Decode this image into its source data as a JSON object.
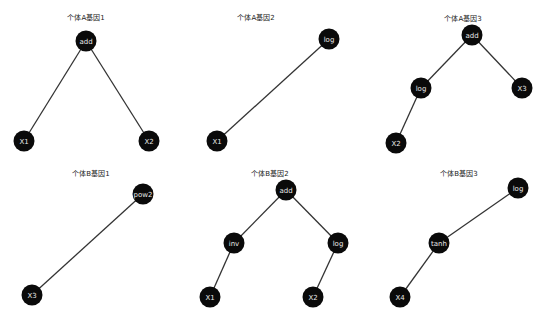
{
  "trees": [
    {
      "title": "个体A基因1",
      "title_pos": [
        86,
        17
      ],
      "nodes": [
        {
          "label": "add",
          "x": 86,
          "y": 41
        },
        {
          "label": "X1",
          "x": 24,
          "y": 141
        },
        {
          "label": "X2",
          "x": 149,
          "y": 141
        }
      ],
      "edges": [
        [
          0,
          1
        ],
        [
          0,
          2
        ]
      ]
    },
    {
      "title": "个体A基因2",
      "title_pos": [
        256,
        17
      ],
      "nodes": [
        {
          "label": "log",
          "x": 329,
          "y": 39
        },
        {
          "label": "X1",
          "x": 217,
          "y": 141
        }
      ],
      "edges": [
        [
          0,
          1
        ]
      ]
    },
    {
      "title": "个体A基因3",
      "title_pos": [
        463,
        18
      ],
      "nodes": [
        {
          "label": "add",
          "x": 472,
          "y": 35
        },
        {
          "label": "log",
          "x": 421,
          "y": 88
        },
        {
          "label": "X3",
          "x": 522,
          "y": 88
        },
        {
          "label": "X2",
          "x": 396,
          "y": 143
        }
      ],
      "edges": [
        [
          0,
          1
        ],
        [
          0,
          2
        ],
        [
          1,
          3
        ]
      ]
    },
    {
      "title": "个体B基因1",
      "title_pos": [
        91,
        173
      ],
      "nodes": [
        {
          "label": "pow2",
          "x": 143,
          "y": 194
        },
        {
          "label": "X3",
          "x": 32,
          "y": 295
        }
      ],
      "edges": [
        [
          0,
          1
        ]
      ]
    },
    {
      "title": "个体B基因2",
      "title_pos": [
        270,
        173
      ],
      "nodes": [
        {
          "label": "add",
          "x": 286,
          "y": 190
        },
        {
          "label": "inv",
          "x": 234,
          "y": 243
        },
        {
          "label": "log",
          "x": 338,
          "y": 243
        },
        {
          "label": "X1",
          "x": 210,
          "y": 297
        },
        {
          "label": "X2",
          "x": 313,
          "y": 297
        }
      ],
      "edges": [
        [
          0,
          1
        ],
        [
          0,
          2
        ],
        [
          1,
          3
        ],
        [
          2,
          4
        ]
      ]
    },
    {
      "title": "个体B基因3",
      "title_pos": [
        459,
        173
      ],
      "nodes": [
        {
          "label": "log",
          "x": 518,
          "y": 188
        },
        {
          "label": "tanh",
          "x": 439,
          "y": 243
        },
        {
          "label": "X4",
          "x": 400,
          "y": 297
        }
      ],
      "edges": [
        [
          0,
          1
        ],
        [
          1,
          2
        ]
      ]
    }
  ],
  "colors": {
    "node_fill": "#0a0a0a",
    "node_text": "#e8e8e8",
    "edge": "#333333",
    "background": "#ffffff"
  }
}
